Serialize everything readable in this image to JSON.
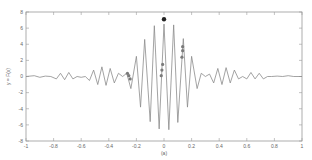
{
  "chart_data": {
    "type": "line",
    "title": "",
    "xlabel": "(a)",
    "ylabel": "y = F(x)",
    "xlim": [
      -1,
      1
    ],
    "ylim": [
      -8,
      8
    ],
    "grid": false,
    "legend": null,
    "x_ticks": [
      -1,
      -0.8,
      -0.6,
      -0.4,
      -0.2,
      0,
      0.2,
      0.4,
      0.6,
      0.8,
      1
    ],
    "x_tick_labels": [
      "-1",
      "-0.8",
      "-0.6",
      "-0.4",
      "-0.2",
      "0",
      "0.2",
      "0.4",
      "0.6",
      "0.8",
      "1"
    ],
    "y_ticks": [
      8,
      6,
      4,
      2,
      0,
      -2,
      -4,
      -6,
      -8
    ],
    "y_tick_labels": [
      "8",
      "6",
      "4",
      "2",
      "0",
      "-2",
      "-4",
      "-6",
      "-8"
    ],
    "series": [
      {
        "name": "waveform",
        "color": "#8c8c8c",
        "x": [
          -1.0,
          -0.94,
          -0.9,
          -0.86,
          -0.82,
          -0.78,
          -0.75,
          -0.72,
          -0.69,
          -0.66,
          -0.63,
          -0.6,
          -0.57,
          -0.54,
          -0.51,
          -0.48,
          -0.45,
          -0.42,
          -0.39,
          -0.36,
          -0.33,
          -0.3,
          -0.27,
          -0.24,
          -0.2,
          -0.17,
          -0.14,
          -0.1,
          -0.07,
          -0.035,
          0.0,
          0.035,
          0.07,
          0.1,
          0.14,
          0.17,
          0.2,
          0.24,
          0.27,
          0.3,
          0.33,
          0.36,
          0.39,
          0.42,
          0.45,
          0.48,
          0.51,
          0.54,
          0.57,
          0.6,
          0.63,
          0.66,
          0.69,
          0.72,
          0.75,
          0.78,
          0.82,
          0.86,
          0.9,
          0.94,
          1.0
        ],
        "y": [
          0.0,
          0.1,
          -0.1,
          0.05,
          0.0,
          -0.3,
          0.4,
          -0.4,
          0.5,
          -0.3,
          0.0,
          -0.1,
          0.0,
          -0.5,
          0.8,
          -1.0,
          1.2,
          -1.1,
          1.0,
          -0.8,
          0.4,
          0.0,
          0.4,
          -1.5,
          2.5,
          -3.8,
          4.6,
          -5.6,
          6.3,
          -6.5,
          6.5,
          -6.6,
          6.4,
          -5.7,
          4.7,
          -3.8,
          2.5,
          -1.5,
          0.4,
          0.0,
          0.3,
          -0.8,
          1.0,
          -1.0,
          1.1,
          -0.8,
          0.8,
          -0.3,
          0.0,
          -0.3,
          0.5,
          -0.3,
          0.4,
          -0.3,
          0.0,
          0.0,
          0.05,
          0.0,
          0.1,
          0.0,
          0.0
        ]
      }
    ],
    "markers": [
      {
        "x": 0.0,
        "y": 7.1,
        "color": "#222222",
        "r": 2.2
      },
      {
        "x": -0.265,
        "y": 0.4,
        "color": "#7a7a7a",
        "r": 1.6
      },
      {
        "x": -0.255,
        "y": 0.1,
        "color": "#7a7a7a",
        "r": 1.6
      },
      {
        "x": -0.245,
        "y": -0.3,
        "color": "#7a7a7a",
        "r": 1.6
      },
      {
        "x": -0.01,
        "y": 1.5,
        "color": "#7a7a7a",
        "r": 1.6
      },
      {
        "x": -0.015,
        "y": 0.8,
        "color": "#7a7a7a",
        "r": 1.6
      },
      {
        "x": -0.02,
        "y": 0.1,
        "color": "#7a7a7a",
        "r": 1.6
      },
      {
        "x": 0.135,
        "y": 3.7,
        "color": "#7a7a7a",
        "r": 1.6
      },
      {
        "x": 0.135,
        "y": 3.2,
        "color": "#7a7a7a",
        "r": 1.6
      },
      {
        "x": 0.13,
        "y": 2.4,
        "color": "#7a7a7a",
        "r": 1.6
      }
    ]
  },
  "layout": {
    "plot_left": 26,
    "plot_top": 12,
    "plot_right": 302,
    "plot_bottom": 141,
    "axis_color": "#9a9a9a"
  }
}
